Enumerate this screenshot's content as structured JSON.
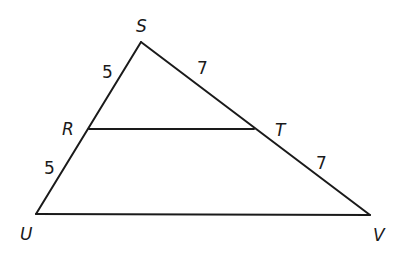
{
  "diagram": {
    "type": "geometry-triangle",
    "vertices": {
      "S": {
        "label": "S",
        "x": 141,
        "y": 42
      },
      "R": {
        "label": "R",
        "x": 89,
        "y": 129
      },
      "T": {
        "label": "T",
        "x": 254,
        "y": 129
      },
      "U": {
        "label": "U",
        "x": 36,
        "y": 214
      },
      "V": {
        "label": "V",
        "x": 370,
        "y": 215
      }
    },
    "segments": [
      {
        "from": "S",
        "to": "U"
      },
      {
        "from": "S",
        "to": "V"
      },
      {
        "from": "U",
        "to": "V"
      },
      {
        "from": "R",
        "to": "T"
      }
    ],
    "side_labels": {
      "SR": "5",
      "RU": "5",
      "ST": "7",
      "TV": "7"
    },
    "stroke_color": "#1a1a1a"
  }
}
